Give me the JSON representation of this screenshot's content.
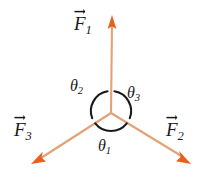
{
  "figure": {
    "background_color": "#ffffff",
    "width": 209,
    "height": 192
  },
  "colors": {
    "vector_shaft": "#e2a277",
    "vector_head": "#e8601c",
    "arc_stroke": "#1a1a1a",
    "label_text": "#1a1a1a"
  },
  "origin": {
    "x": 111,
    "y": 113
  },
  "vectors": [
    {
      "id": "F1",
      "label": "F",
      "subscript": "1",
      "direction_deg": 90,
      "tip": {
        "x": 112,
        "y": 16
      },
      "label_pos": {
        "x": 74,
        "y": 14
      }
    },
    {
      "id": "F2",
      "label": "F",
      "subscript": "2",
      "direction_deg": -29,
      "tip": {
        "x": 191,
        "y": 163
      },
      "label_pos": {
        "x": 166,
        "y": 120
      }
    },
    {
      "id": "F3",
      "label": "F",
      "subscript": "3",
      "direction_deg": 209,
      "tip": {
        "x": 32,
        "y": 164
      },
      "label_pos": {
        "x": 14,
        "y": 120
      }
    }
  ],
  "angles": [
    {
      "id": "theta1",
      "label": "θ",
      "subscript": "1",
      "between": [
        "F3",
        "F2"
      ],
      "label_pos": {
        "x": 98,
        "y": 138
      }
    },
    {
      "id": "theta2",
      "label": "θ",
      "subscript": "2",
      "between": [
        "F1",
        "F3"
      ],
      "label_pos": {
        "x": 70,
        "y": 78
      }
    },
    {
      "id": "theta3",
      "label": "θ",
      "subscript": "3",
      "between": [
        "F1",
        "F2"
      ],
      "label_pos": {
        "x": 127,
        "y": 85
      }
    }
  ],
  "arc": {
    "center": {
      "x": 111,
      "y": 111
    },
    "radius": 20,
    "stroke_width": 2.1,
    "segments": [
      {
        "id": "arc-theta3",
        "start_deg": 80,
        "end_deg": -20
      },
      {
        "id": "arc-theta1",
        "start_deg": -38,
        "end_deg": -142
      },
      {
        "id": "arc-theta2",
        "start_deg": -160,
        "end_deg": -260
      }
    ]
  }
}
